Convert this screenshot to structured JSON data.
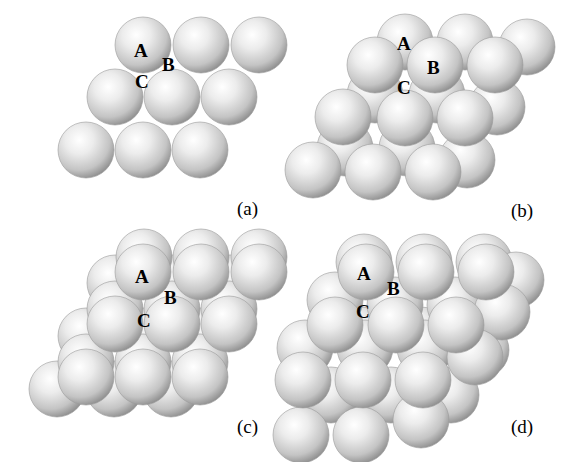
{
  "colors": {
    "sphere_light": "#ffffff",
    "sphere_mid": "#d8d8d8",
    "sphere_dark": "#8a8a8a",
    "background": "#ffffff"
  },
  "sphere_radius": 28,
  "panels": [
    {
      "id": "a",
      "caption": "(a)",
      "caption_pos": [
        237,
        215
      ],
      "layers": [
        {
          "name": "layer-A",
          "spheres": [
            [
              143,
              45
            ],
            [
              201,
              45
            ],
            [
              259,
              45
            ],
            [
              115,
              97
            ],
            [
              172,
              97
            ],
            [
              229,
              97
            ],
            [
              86,
              150
            ],
            [
              143,
              150
            ],
            [
              200,
              150
            ]
          ]
        }
      ],
      "labels": [
        {
          "text": "A",
          "pos": [
            134,
            57
          ]
        },
        {
          "text": "B",
          "pos": [
            162,
            71
          ]
        },
        {
          "text": "C",
          "pos": [
            135,
            88
          ]
        }
      ]
    },
    {
      "id": "b",
      "caption": "(b)",
      "caption_pos": [
        511,
        217
      ],
      "layers": [
        {
          "name": "layer-A",
          "spheres": [
            [
              405,
              42
            ],
            [
              465,
              42
            ],
            [
              527,
              47
            ],
            [
              375,
              95
            ],
            [
              437,
              95
            ],
            [
              497,
              107
            ],
            [
              345,
              148
            ],
            [
              407,
              148
            ],
            [
              467,
              160
            ]
          ]
        },
        {
          "name": "layer-B",
          "spheres": [
            [
              375,
              65
            ],
            [
              435,
              65
            ],
            [
              495,
              65
            ],
            [
              343,
              117
            ],
            [
              405,
              118
            ],
            [
              465,
              118
            ],
            [
              313,
              170
            ],
            [
              373,
              172
            ],
            [
              433,
              172
            ]
          ]
        }
      ],
      "labels": [
        {
          "text": "A",
          "pos": [
            397,
            50
          ]
        },
        {
          "text": "B",
          "pos": [
            427,
            74
          ]
        },
        {
          "text": "C",
          "pos": [
            397,
            94
          ]
        }
      ]
    },
    {
      "id": "c",
      "caption": "(c)",
      "caption_pos": [
        237,
        433
      ],
      "layers": [
        {
          "name": "layer-C",
          "spheres": [
            [
              115,
              283
            ],
            [
              172,
              283
            ],
            [
              230,
              283
            ],
            [
              86,
              336
            ],
            [
              143,
              336
            ],
            [
              201,
              336
            ],
            [
              57,
              389
            ],
            [
              114,
              389
            ],
            [
              171,
              389
            ]
          ]
        },
        {
          "name": "layer-A-mid",
          "spheres": [
            [
              144,
              257
            ],
            [
              201,
              257
            ],
            [
              259,
              257
            ],
            [
              115,
              309
            ],
            [
              172,
              309
            ],
            [
              229,
              309
            ],
            [
              86,
              362
            ],
            [
              143,
              362
            ],
            [
              200,
              362
            ]
          ]
        },
        {
          "name": "layer-A",
          "spheres": [
            [
              143,
              272
            ],
            [
              201,
              272
            ],
            [
              259,
              272
            ],
            [
              115,
              324
            ],
            [
              172,
              324
            ],
            [
              229,
              324
            ],
            [
              86,
              377
            ],
            [
              143,
              377
            ],
            [
              200,
              377
            ]
          ]
        }
      ],
      "labels": [
        {
          "text": "A",
          "pos": [
            135,
            283
          ]
        },
        {
          "text": "B",
          "pos": [
            164,
            304
          ]
        },
        {
          "text": "C",
          "pos": [
            137,
            327
          ]
        }
      ]
    },
    {
      "id": "d",
      "caption": "(d)",
      "caption_pos": [
        511,
        433
      ],
      "layers": [
        {
          "name": "layer-bottom",
          "spheres": [
            [
              361,
              335
            ],
            [
              421,
              335
            ],
            [
              481,
              350
            ],
            [
              331,
              395
            ],
            [
              391,
              395
            ],
            [
              451,
              395
            ],
            [
              301,
              435
            ],
            [
              361,
              435
            ],
            [
              421,
              420
            ]
          ]
        },
        {
          "name": "layer-back",
          "spheres": [
            [
              364,
              262
            ],
            [
              424,
              262
            ],
            [
              484,
              262
            ],
            [
              516,
              280
            ],
            [
              335,
              300
            ],
            [
              395,
              305
            ],
            [
              455,
              305
            ],
            [
              502,
              312
            ],
            [
              305,
              348
            ],
            [
              365,
              348
            ],
            [
              425,
              348
            ],
            [
              475,
              357
            ]
          ]
        },
        {
          "name": "layer-front-top",
          "spheres": [
            [
              366,
              272
            ],
            [
              426,
              272
            ],
            [
              486,
              272
            ],
            [
              335,
              325
            ],
            [
              396,
              325
            ],
            [
              456,
              325
            ],
            [
              303,
              380
            ],
            [
              363,
              380
            ],
            [
              423,
              380
            ]
          ]
        }
      ],
      "labels": [
        {
          "text": "A",
          "pos": [
            357,
            280
          ]
        },
        {
          "text": "B",
          "pos": [
            387,
            295
          ]
        },
        {
          "text": "C",
          "pos": [
            356,
            318
          ]
        }
      ]
    }
  ]
}
